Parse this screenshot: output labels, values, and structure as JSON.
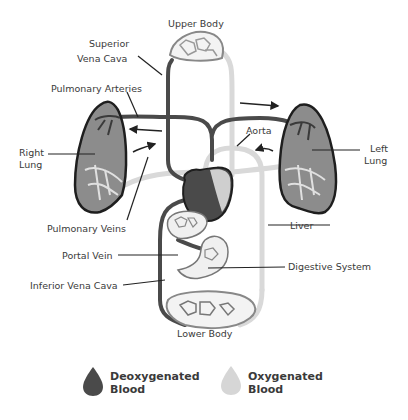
{
  "diagram": {
    "title": "",
    "labels": {
      "upper_body": "Upper Body",
      "superior_vena_cava_1": "Superior",
      "superior_vena_cava_2": "Vena Cava",
      "pulmonary_arteries": "Pulmonary Arteries",
      "right_lung_1": "Right",
      "right_lung_2": "Lung",
      "left_lung_1": "Left",
      "left_lung_2": "Lung",
      "aorta": "Aorta",
      "pulmonary_veins": "Pulmonary Veins",
      "liver": "Liver",
      "portal_vein": "Portal Vein",
      "digestive_system": "Digestive System",
      "inferior_vena_cava": "Inferior Vena Cava",
      "lower_body": "Lower Body"
    },
    "legend": [
      {
        "label_1": "Deoxygenated",
        "label_2": "Blood",
        "color": "#4a4a4a"
      },
      {
        "label_1": "Oxygenated",
        "label_2": "Blood",
        "color": "#d6d6d6"
      }
    ],
    "colors": {
      "deoxygenated": "#4a4a4a",
      "oxygenated": "#d9d9d9",
      "lung_fill": "#8c8c8c",
      "outline": "#1e1e1e"
    }
  }
}
